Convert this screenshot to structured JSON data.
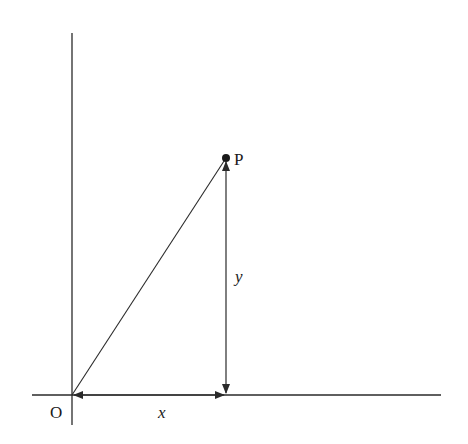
{
  "diagram": {
    "colors": {
      "line": "#2a2a2a",
      "text": "#1a1a1a",
      "background": "#ffffff"
    },
    "origin_label": "O",
    "point_label": "P",
    "x_label": "x",
    "y_label": "y",
    "geometry": {
      "origin": [
        72,
        395
      ],
      "point": [
        226,
        158
      ],
      "x_axis": [
        32,
        441
      ],
      "y_axis": [
        33,
        425
      ]
    }
  }
}
